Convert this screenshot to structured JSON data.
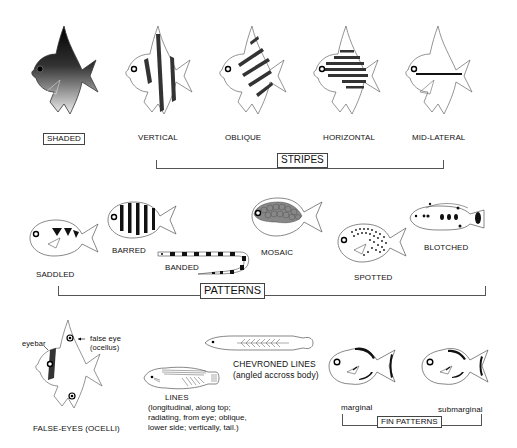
{
  "stripes": {
    "group_label": "STRIPES",
    "items": [
      {
        "label": "SHADED"
      },
      {
        "label": "VERTICAL"
      },
      {
        "label": "OBLIQUE"
      },
      {
        "label": "HORIZONTAL"
      },
      {
        "label": "MID-LATERAL"
      }
    ]
  },
  "patterns": {
    "group_label": "PATTERNS",
    "items": [
      {
        "label": "SADDLED"
      },
      {
        "label": "BARRED"
      },
      {
        "label": "BANDED"
      },
      {
        "label": "MOSAIC"
      },
      {
        "label": "SPOTTED"
      },
      {
        "label": "BLOTCHED"
      }
    ]
  },
  "false_eyes": {
    "label": "FALSE-EYES (OCELLI)",
    "callout_eyebar": "eyebar",
    "callout_false_eye_1": "false eye",
    "callout_false_eye_2": "(ocellus)"
  },
  "lines": {
    "label": "LINES",
    "desc_1": "(longitudinal, along top;",
    "desc_2": "radiating, from eye; oblique,",
    "desc_3": "lower side; vertically, tail.)"
  },
  "chevroned": {
    "label": "CHEVRONED LINES",
    "desc": "(angled accross body)"
  },
  "fin_patterns": {
    "group_label": "FIN PATTERNS",
    "items": [
      {
        "label": "marginal"
      },
      {
        "label": "submarginal"
      }
    ]
  },
  "colors": {
    "ink": "#111111",
    "stripe": "#333333",
    "outline": "#555555",
    "mosaic": "#777777",
    "background": "#ffffff"
  }
}
